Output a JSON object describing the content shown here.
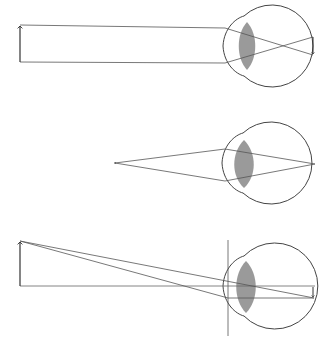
{
  "diagram": {
    "type": "optics-eye-image-formation",
    "colors": {
      "background": "#ffffff",
      "line": "#555555",
      "outline": "#444444",
      "lens_fill": "#9a9a9a",
      "arrow": "#333333"
    },
    "panels": [
      {
        "id": "distant-object",
        "description": "Parallel rays from a distant upright object focus to an inverted image on the retina",
        "object_arrow": {
          "x": 20,
          "y_base": 62,
          "y_tip": 25
        },
        "eye": {
          "cx": 276,
          "cy": 46,
          "r": 41,
          "cornea_left_x": 223,
          "cornea_top_y": 16,
          "cornea_bottom_y": 76
        },
        "lens": {
          "cx": 247,
          "cy": 46,
          "half_width": 9,
          "half_height": 24
        },
        "image_arrow": {
          "x": 313,
          "y_top": 37,
          "y_tip": 55
        }
      },
      {
        "id": "point-source",
        "description": "Rays diverging from a near point source converge to a point on the retina",
        "source_point": {
          "x": 115,
          "y": 163
        },
        "eye": {
          "cx": 276,
          "cy": 163,
          "r": 41,
          "cornea_left_x": 222,
          "cornea_top_y": 133,
          "cornea_bottom_y": 193
        },
        "lens": {
          "cx": 244,
          "cy": 164,
          "half_width": 11,
          "half_height": 24
        },
        "focus_point": {
          "x": 315,
          "y": 164
        }
      },
      {
        "id": "optical-axis",
        "description": "Rays from object tip through lens to inverted image, with optical axis and cornea reference line",
        "object_arrow": {
          "x": 20,
          "y_base": 286,
          "y_tip": 241
        },
        "eye": {
          "cx": 276,
          "cy": 286,
          "r": 43,
          "cornea_left_x": 223,
          "cornea_top_y": 256,
          "cornea_bottom_y": 316
        },
        "lens": {
          "cx": 246,
          "cy": 287,
          "half_width": 11,
          "half_height": 26
        },
        "reference_line": {
          "x": 228,
          "y_top": 240,
          "y_bottom": 336
        },
        "image_arrow": {
          "x": 313,
          "y_top": 286,
          "y_tip": 298
        }
      }
    ]
  }
}
